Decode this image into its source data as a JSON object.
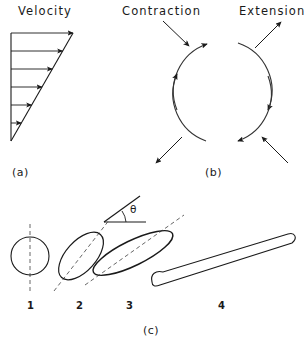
{
  "figure": {
    "panels": [
      {
        "id": "a",
        "tag": "(a)",
        "title": "Velocity",
        "description": "triangular velocity profile with six horizontal arrows of increasing length"
      },
      {
        "id": "b",
        "tag": "(b)",
        "titles": [
          "Contraction",
          "Extension"
        ],
        "description": "four circular arcs with arrowheads plus four straight arrows"
      },
      {
        "id": "c",
        "tag": "(c)",
        "shape_labels": [
          "1",
          "2",
          "3",
          "4"
        ],
        "angle_symbol": "θ",
        "description": "progressive deformation of a circle into elongated ellipses"
      }
    ]
  },
  "panel_a": {
    "title": "Velocity",
    "tag": "(a)",
    "arrow_count": 6,
    "axis": {
      "x": 11,
      "y_top": 33,
      "y_bottom": 141
    },
    "apex": {
      "x": 11,
      "y": 141
    },
    "top_right": {
      "x": 73,
      "y": 33
    },
    "arrow_rows": [
      {
        "y": 33,
        "x_end": 73
      },
      {
        "y": 51,
        "x_end": 62.6
      },
      {
        "y": 69,
        "x_end": 52.3
      },
      {
        "y": 87,
        "x_end": 41.9
      },
      {
        "y": 105,
        "x_end": 31.6
      },
      {
        "y": 123,
        "x_end": 21.2
      }
    ]
  },
  "panel_b": {
    "tag": "(b)",
    "title_left": "Contraction",
    "title_right": "Extension",
    "circle_center": {
      "x": 222,
      "y": 92
    },
    "circle_radius": 50,
    "arcs": [
      {
        "quadrant": "upper-left",
        "arrow_at": "end",
        "sweep": "clockwise"
      },
      {
        "quadrant": "upper-right",
        "arrow_at": "end",
        "sweep": "clockwise"
      },
      {
        "quadrant": "lower-right",
        "arrow_at": "end",
        "sweep": "clockwise"
      },
      {
        "quadrant": "lower-left",
        "arrow_at": "end",
        "sweep": "clockwise"
      }
    ],
    "straight_arrows": [
      {
        "label": "contraction-top",
        "direction": "down-right"
      },
      {
        "label": "extension-top",
        "direction": "up-right"
      },
      {
        "label": "extension-bottom",
        "direction": "up-left"
      },
      {
        "label": "contraction-bottom",
        "direction": "down-left"
      }
    ]
  },
  "panel_c": {
    "tag": "(c)",
    "angle_symbol": "θ",
    "shapes": [
      {
        "label": "1",
        "kind": "circle",
        "cx": 30,
        "cy": 256,
        "rx": 19,
        "ry": 19,
        "tilt": 0,
        "dashed_axis": true
      },
      {
        "label": "2",
        "kind": "ellipse",
        "cx": 81,
        "cy": 256,
        "rx": 28,
        "ry": 15,
        "tilt": -48,
        "dashed_axis": true
      },
      {
        "label": "3",
        "kind": "ellipse",
        "cx": 133,
        "cy": 253,
        "rx": 43,
        "ry": 12,
        "tilt": -26,
        "dashed_axis": true
      },
      {
        "label": "4",
        "kind": "elongated-sliver",
        "cx": 222,
        "cy": 255,
        "rx": 74,
        "ry": 5,
        "tilt": -13,
        "dashed_axis": false
      }
    ],
    "label_y": 307,
    "tag_position": {
      "x": 152,
      "y": 330
    }
  },
  "colors": {
    "ink": "#1a1a1a",
    "stroke": "#333333",
    "background": "#ffffff"
  }
}
